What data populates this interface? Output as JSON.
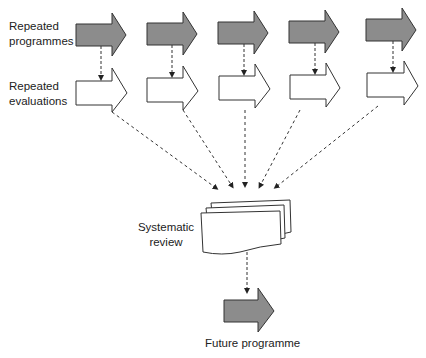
{
  "labels": {
    "repeated_programmes_1": "Repeated",
    "repeated_programmes_2": "programmes",
    "repeated_evaluations_1": "Repeated",
    "repeated_evaluations_2": "evaluations",
    "systematic_review_1": "Systematic",
    "systematic_review_2": "review",
    "future_programme": "Future programme"
  },
  "colors": {
    "filled_arrow": "#8c8c8c",
    "outline": "#333333",
    "background": "#ffffff"
  },
  "programmes_count": 5,
  "evaluations_count": 5
}
